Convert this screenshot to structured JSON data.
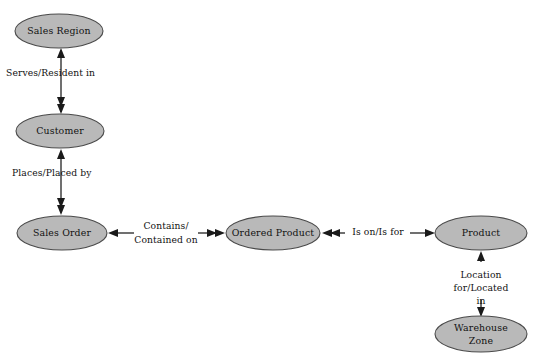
{
  "diagram": {
    "background_color": "#ffffff",
    "node_fill_color": "#b9b9b9",
    "node_stroke_color": "#4a4a4a",
    "line_color": "#1a1a1a",
    "text_color": "#111111",
    "nodes": [
      {
        "id": "sales-region",
        "label": "Sales Region",
        "cx": 59,
        "cy": 31,
        "rx": 44,
        "ry": 17
      },
      {
        "id": "customer",
        "label": "Customer",
        "cx": 60,
        "cy": 131,
        "rx": 44,
        "ry": 17
      },
      {
        "id": "sales-order",
        "label": "Sales Order",
        "cx": 62,
        "cy": 233,
        "rx": 45,
        "ry": 17
      },
      {
        "id": "ordered-product",
        "label": "Ordered Product",
        "cx": 273,
        "cy": 233,
        "rx": 47,
        "ry": 17
      },
      {
        "id": "product",
        "label": "Product",
        "cx": 481,
        "cy": 233,
        "rx": 46,
        "ry": 17
      },
      {
        "id": "warehouse-zone",
        "label_line1": "Warehouse",
        "label_line2": "Zone",
        "cx": 481,
        "cy": 334,
        "rx": 46,
        "ry": 18
      }
    ],
    "edges": [
      {
        "id": "sales-region-customer",
        "from": "customer",
        "to": "sales-region",
        "label": "Serves/Resident in",
        "label_lines": [
          "Serves/Resident in"
        ],
        "orientation": "vertical",
        "label_x": 6,
        "label_y": 73,
        "label_align": "start"
      },
      {
        "id": "customer-sales-order",
        "from": "sales-order",
        "to": "customer",
        "label": "Places/Placed by",
        "label_lines": [
          "Places/Placed by"
        ],
        "orientation": "vertical",
        "label_x": 12,
        "label_y": 173,
        "label_align": "start"
      },
      {
        "id": "sales-order-ordered-product",
        "from": "sales-order",
        "to": "ordered-product",
        "label": "Contains/Contained on",
        "label_lines": [
          "Contains/",
          "Contained on"
        ],
        "orientation": "horizontal",
        "label_x": 166,
        "label_y": 226,
        "label_align": "center"
      },
      {
        "id": "ordered-product-product",
        "from": "ordered-product",
        "to": "product",
        "label": "Is on/Is for",
        "label_lines": [
          "Is on/Is for"
        ],
        "orientation": "horizontal",
        "label_x": 378,
        "label_y": 232,
        "label_align": "center"
      },
      {
        "id": "product-warehouse-zone",
        "from": "warehouse-zone",
        "to": "product",
        "label": "Location for/Located in",
        "label_lines": [
          "Location",
          "for/Located",
          "in"
        ],
        "orientation": "vertical",
        "label_x": 481,
        "label_y": 275,
        "label_align": "center"
      }
    ]
  }
}
